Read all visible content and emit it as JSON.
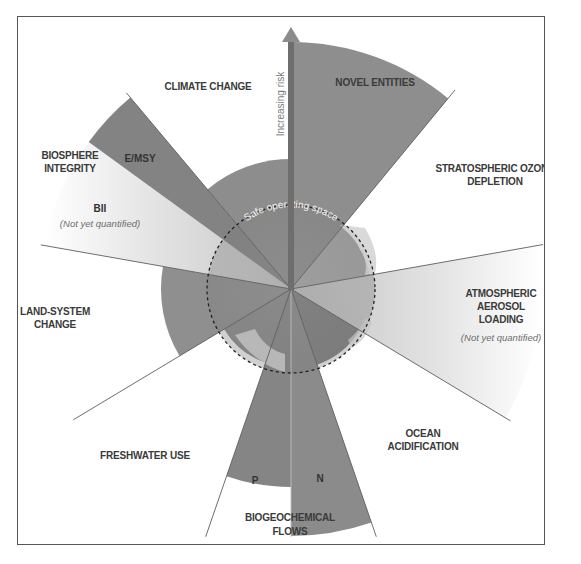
{
  "diagram": {
    "center": {
      "x": 291,
      "y": 289
    },
    "safe_radius": 84,
    "colors": {
      "dark_wedge": "#8a8a8a",
      "earth_dark": "#7c7c7c",
      "earth_light": "#b8b8b8",
      "light_gradient_start": "#c8c8c8",
      "light_gradient_end": "#ffffff",
      "frame": "#555555",
      "divider": "#6a6a6a"
    },
    "arrow_label": "Increasing risk",
    "safe_space_label": "Safe operating space",
    "boundaries": [
      {
        "id": "novel-entities",
        "label_lines": [
          "NOVEL ENTITIES"
        ],
        "status": "beyond zone of uncertainty",
        "start_deg": 0,
        "end_deg": 39.5,
        "radius": 247
      },
      {
        "id": "stratospheric-ozone-depletion",
        "label_lines": [
          "STRATOSPHERIC OZONE",
          "DEPLETION"
        ],
        "status": "below boundary (safe)",
        "start_deg": 39.5,
        "end_deg": 80,
        "radius": 80
      },
      {
        "id": "atmospheric-aerosol-loading",
        "label_lines": [
          "ATMOSPHERIC",
          "AEROSOL",
          "LOADING"
        ],
        "note": "(Not yet quantified)",
        "status": "not yet quantified",
        "start_deg": 80,
        "end_deg": 121,
        "radius": 250
      },
      {
        "id": "ocean-acidification",
        "label_lines": [
          "OCEAN",
          "ACIDIFICATION"
        ],
        "status": "below boundary (safe)",
        "start_deg": 121,
        "end_deg": 161,
        "radius": 80
      },
      {
        "id": "biogeochemical-flows-n",
        "sublabel": "N",
        "status": "beyond zone of uncertainty",
        "start_deg": 161,
        "end_deg": 180,
        "radius": 247
      },
      {
        "id": "biogeochemical-flows-p",
        "sublabel": "P",
        "status": "beyond zone of uncertainty",
        "start_deg": 180,
        "end_deg": 199,
        "radius": 198
      },
      {
        "id": "biogeochemical-flows",
        "label_lines": [
          "BIOGEOCHEMICAL",
          "FLOWS"
        ]
      },
      {
        "id": "freshwater-use",
        "label_lines": [
          "FRESHWATER USE"
        ],
        "status": "below boundary (safe)",
        "start_deg": 199,
        "end_deg": 239,
        "radius": 78
      },
      {
        "id": "land-system-change",
        "label_lines": [
          "LAND-SYSTEM",
          "CHANGE"
        ],
        "status": "in zone of uncertainty",
        "start_deg": 239,
        "end_deg": 280,
        "radius": 130
      },
      {
        "id": "biosphere-integrity-bii",
        "sublabel": "BII",
        "note": "(Not yet quantified)",
        "status": "not yet quantified",
        "start_deg": 280,
        "end_deg": 306,
        "radius": 250
      },
      {
        "id": "biosphere-integrity-emsy",
        "sublabel": "E/MSY",
        "status": "beyond zone of uncertainty",
        "start_deg": 306,
        "end_deg": 320,
        "radius": 250
      },
      {
        "id": "biosphere-integrity",
        "label_lines": [
          "BIOSPHERE",
          "INTEGRITY"
        ]
      },
      {
        "id": "climate-change",
        "label_lines": [
          "CLIMATE CHANGE"
        ],
        "status": "in zone of uncertainty",
        "start_deg": 320,
        "end_deg": 360,
        "radius": 130
      }
    ],
    "labels": {
      "climate_change": "CLIMATE CHANGE",
      "novel_entities": "NOVEL ENTITIES",
      "ozone_1": "STRATOSPHERIC OZONE",
      "ozone_2": "DEPLETION",
      "aerosol_1": "ATMOSPHERIC",
      "aerosol_2": "AEROSOL",
      "aerosol_3": "LOADING",
      "aerosol_note": "(Not yet quantified)",
      "ocean_1": "OCEAN",
      "ocean_2": "ACIDIFICATION",
      "biogeo_1": "BIOGEOCHEMICAL",
      "biogeo_2": "FLOWS",
      "biogeo_n": "N",
      "biogeo_p": "P",
      "freshwater": "FRESHWATER USE",
      "land_1": "LAND-SYSTEM",
      "land_2": "CHANGE",
      "biosphere_1": "BIOSPHERE",
      "biosphere_2": "INTEGRITY",
      "emsy": "E/MSY",
      "bii": "BII",
      "bii_note": "(Not yet quantified)"
    }
  }
}
